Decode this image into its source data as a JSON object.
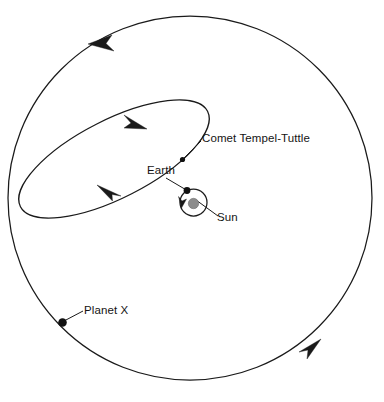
{
  "diagram": {
    "background_color": "#ffffff",
    "stroke_color": "#1a1a1a",
    "sun_color": "#8c8c8c",
    "labels": {
      "comet": "Comet Tempel-Tuttle",
      "earth": "Earth",
      "sun": "Sun",
      "planet_x": "Planet X"
    },
    "bodies": [
      {
        "name": "Sun",
        "kind": "star",
        "cx": 193.5,
        "cy": 203.5,
        "r": 5.2,
        "color": "#8c8c8c"
      },
      {
        "name": "Earth",
        "kind": "planet",
        "cx": 187.0,
        "cy": 190.5,
        "r": 3.4,
        "color": "#111111"
      },
      {
        "name": "Comet Tempel-Tuttle",
        "kind": "comet",
        "cx": 182.5,
        "cy": 159.5,
        "r": 2.6,
        "color": "#111111"
      },
      {
        "name": "Planet X",
        "kind": "planet",
        "cx": 62.5,
        "cy": 322.5,
        "r": 4.3,
        "color": "#111111"
      }
    ],
    "orbits": [
      {
        "name": "planet-x-orbit",
        "shape": "circle",
        "cx": 190,
        "cy": 198,
        "r": 182,
        "stroke_width": 1.25,
        "direction": "counterclockwise",
        "arrow_positions": [
          "top-left",
          "bottom-right"
        ]
      },
      {
        "name": "comet-orbit",
        "shape": "ellipse",
        "rx": 105,
        "ry": 39,
        "cx": 114,
        "cy": 159,
        "rotation_deg": -27,
        "stroke_width": 1.25,
        "direction": "clockwise",
        "arrow_positions": [
          "upper-right",
          "lower-left"
        ]
      },
      {
        "name": "earth-orbit",
        "shape": "circle",
        "cx": 193.5,
        "cy": 202.5,
        "r": 13.5,
        "stroke_width": 1.25,
        "direction": "clockwise",
        "arrow_positions": [
          "left"
        ]
      }
    ]
  }
}
